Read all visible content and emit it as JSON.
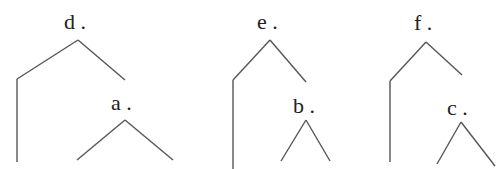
{
  "diagram": {
    "type": "syntax-trees",
    "line_color": "#555555",
    "text_color": "#222222",
    "background": "#ffffff",
    "trees": [
      {
        "root_label": "d .",
        "child_label": "a .",
        "root_label_pos": [
          64,
          11
        ],
        "child_label_pos": [
          111,
          92
        ],
        "edges": [
          [
            78,
            40,
            17,
            79
          ],
          [
            17,
            79,
            17,
            162
          ],
          [
            78,
            40,
            125,
            80
          ],
          [
            125,
            120,
            77,
            160
          ],
          [
            125,
            120,
            173,
            160
          ]
        ]
      },
      {
        "root_label": "e .",
        "child_label": "b .",
        "root_label_pos": [
          257,
          11
        ],
        "child_label_pos": [
          293,
          95
        ],
        "edges": [
          [
            270,
            40,
            233,
            80
          ],
          [
            233,
            80,
            233,
            169
          ],
          [
            270,
            40,
            306,
            82
          ],
          [
            306,
            120,
            281,
            161
          ],
          [
            306,
            120,
            330,
            161
          ]
        ]
      },
      {
        "root_label": "f .",
        "child_label": "c .",
        "root_label_pos": [
          414,
          12
        ],
        "child_label_pos": [
          447,
          97
        ],
        "edges": [
          [
            426,
            42,
            390,
            81
          ],
          [
            390,
            81,
            390,
            162
          ],
          [
            426,
            42,
            462,
            75
          ],
          [
            461,
            122,
            437,
            164
          ],
          [
            461,
            122,
            495,
            166
          ]
        ]
      }
    ]
  }
}
